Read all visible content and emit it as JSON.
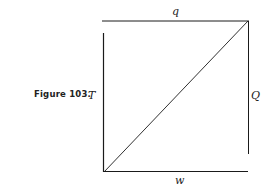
{
  "figure": {
    "caption": "Figure 103.",
    "labels": {
      "top": "q",
      "left": "T",
      "right": "Q",
      "bottom": "w"
    },
    "colors": {
      "line": "#1a1a1a",
      "background": "#ffffff"
    }
  }
}
